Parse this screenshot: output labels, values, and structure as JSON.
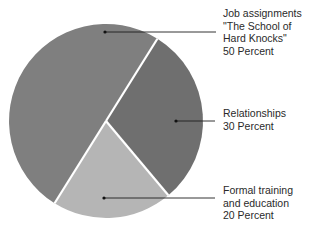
{
  "chart_data": {
    "type": "pie",
    "title": "",
    "categories": [
      "Job assignments \"The School of Hard Knocks\"",
      "Relationships",
      "Formal training and education"
    ],
    "values": [
      50,
      30,
      20
    ],
    "unit": "Percent",
    "slices": [
      {
        "name": "Job assignments \"The School of Hard Knocks\"",
        "value": 50,
        "color": "#7f7f7f",
        "label_lines": [
          "Job assignments",
          "\"The School of",
          "Hard Knocks\"",
          "50 Percent"
        ]
      },
      {
        "name": "Relationships",
        "value": 30,
        "color": "#6f6f6f",
        "label_lines": [
          "Relationships",
          "30 Percent"
        ]
      },
      {
        "name": "Formal training and education",
        "value": 20,
        "color": "#b5b5b5",
        "label_lines": [
          "Formal training",
          "and education",
          "20 Percent"
        ]
      }
    ],
    "legend_position": "right (leader-line callouts)",
    "grid": false
  }
}
